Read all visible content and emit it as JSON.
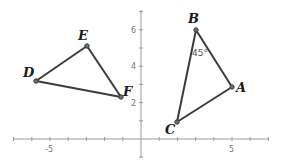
{
  "diagram": {
    "type": "coordinate-plane",
    "axes": {
      "x_tick_labels": [
        {
          "value": -5,
          "text": "-5"
        },
        {
          "value": 5,
          "text": "5"
        }
      ],
      "y_tick_labels": [
        {
          "value": 2,
          "text": "2"
        },
        {
          "value": 4,
          "text": "4"
        },
        {
          "value": 6,
          "text": "6"
        }
      ],
      "x_range": [
        -7,
        7
      ],
      "y_range": [
        -1,
        7
      ]
    },
    "triangles": [
      {
        "name": "DEF",
        "vertices": [
          {
            "label": "D",
            "x": -6,
            "y": 3.2
          },
          {
            "label": "E",
            "x": -3,
            "y": 5
          },
          {
            "label": "F",
            "x": -1,
            "y": 2.3
          }
        ]
      },
      {
        "name": "ABC",
        "vertices": [
          {
            "label": "A",
            "x": 5,
            "y": 2.8
          },
          {
            "label": "B",
            "x": 3,
            "y": 6
          },
          {
            "label": "C",
            "x": 2,
            "y": 1
          }
        ]
      }
    ],
    "angle_annotation": {
      "vertex": "B",
      "text": "45°"
    }
  },
  "labels": {
    "D": "D",
    "E": "E",
    "F": "F",
    "A": "A",
    "B": "B",
    "C": "C",
    "angle_B": "45°",
    "tick_x_neg5": "-5",
    "tick_x_5": "5",
    "tick_y_2": "2",
    "tick_y_4": "4",
    "tick_y_6": "6"
  }
}
